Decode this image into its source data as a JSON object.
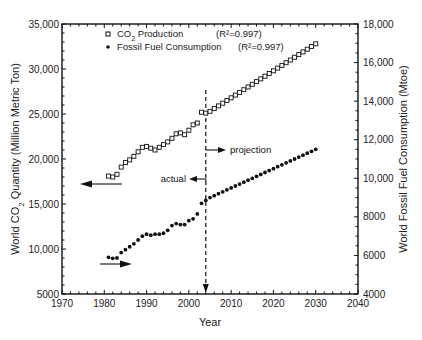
{
  "chart_data": {
    "type": "scatter",
    "title": "",
    "xlabel": "Year",
    "ylabel": "World CO2 Quantity (Million Metric Ton)",
    "ylabel_right": "World Fossil Fuel Consumption (Mtoe)",
    "xlim": [
      1970,
      2040
    ],
    "ylim": [
      5000,
      35000
    ],
    "ylim_right": [
      4000,
      18000
    ],
    "x_ticks": [
      "1970",
      "1980",
      "1990",
      "2000",
      "2010",
      "2020",
      "2030",
      "2040"
    ],
    "y_ticks": [
      "5000",
      "10,000",
      "15,000",
      "20,000",
      "25,000",
      "30,000",
      "35,000"
    ],
    "y_ticks_right": [
      "4000",
      "6000",
      "8000",
      "10,000",
      "12,000",
      "14,000",
      "16,000",
      "18,000"
    ],
    "grid": false,
    "legend_position": "upper left",
    "series": [
      {
        "name": "CO2 Production",
        "r2": "(R²=0.997)",
        "axis": "left",
        "marker": "open-square",
        "x": [
          1981,
          1982,
          1983,
          1984,
          1985,
          1986,
          1987,
          1988,
          1989,
          1990,
          1991,
          1992,
          1993,
          1994,
          1995,
          1996,
          1997,
          1998,
          1999,
          2000,
          2001,
          2002,
          2003,
          2004,
          2005,
          2006,
          2007,
          2008,
          2009,
          2010,
          2011,
          2012,
          2013,
          2014,
          2015,
          2016,
          2017,
          2018,
          2019,
          2020,
          2021,
          2022,
          2023,
          2024,
          2025,
          2026,
          2027,
          2028,
          2029,
          2030
        ],
        "values": [
          18100,
          18000,
          18300,
          19100,
          19600,
          19900,
          20300,
          20800,
          21300,
          21400,
          21200,
          21000,
          21300,
          21600,
          21900,
          22300,
          22800,
          22900,
          22700,
          23200,
          23800,
          24000,
          25200,
          25100,
          25300,
          25600,
          25900,
          26200,
          26500,
          26800,
          27100,
          27400,
          27700,
          28000,
          28300,
          28600,
          28900,
          29200,
          29500,
          29800,
          30100,
          30400,
          30700,
          31000,
          31300,
          31600,
          31900,
          32200,
          32500,
          32800
        ]
      },
      {
        "name": "Fossil Fuel Consumption",
        "r2": "(R²=0.997)",
        "axis": "right",
        "marker": "filled-circle",
        "x": [
          1981,
          1982,
          1983,
          1984,
          1985,
          1986,
          1987,
          1988,
          1989,
          1990,
          1991,
          1992,
          1993,
          1994,
          1995,
          1996,
          1997,
          1998,
          1999,
          2000,
          2001,
          2002,
          2003,
          2004,
          2005,
          2006,
          2007,
          2008,
          2009,
          2010,
          2011,
          2012,
          2013,
          2014,
          2015,
          2016,
          2017,
          2018,
          2019,
          2020,
          2021,
          2022,
          2023,
          2024,
          2025,
          2026,
          2027,
          2028,
          2029,
          2030
        ],
        "values": [
          5900,
          5850,
          5870,
          6150,
          6300,
          6450,
          6600,
          6800,
          7000,
          7100,
          7050,
          7100,
          7100,
          7150,
          7300,
          7550,
          7650,
          7600,
          7600,
          7800,
          7900,
          8150,
          8700,
          8850,
          9000,
          9100,
          9200,
          9300,
          9400,
          9500,
          9600,
          9700,
          9800,
          9900,
          10000,
          10100,
          10200,
          10300,
          10400,
          10500,
          10600,
          10700,
          10800,
          10900,
          11000,
          11100,
          11200,
          11300,
          11400,
          11500
        ]
      }
    ],
    "annotations": [
      {
        "text": "actual",
        "arrow": "left",
        "x": 2004
      },
      {
        "text": "projection",
        "arrow": "right",
        "x": 2004
      },
      {
        "text": "",
        "arrow": "left",
        "desc": "CO2 series uses left axis"
      },
      {
        "text": "",
        "arrow": "right",
        "desc": "Fossil fuel series uses right axis"
      }
    ],
    "divider_year": 2004
  },
  "legend": {
    "co2_label_prefix": "CO",
    "co2_label_sub": "2",
    "co2_label_suffix": " Production",
    "co2_r2": "(R²=0.997)",
    "fuel_label": "Fossil Fuel Consumption",
    "fuel_r2": "(R²=0.997)"
  },
  "annotations": {
    "actual": "actual",
    "projection": "projection"
  },
  "axes": {
    "xlabel": "Year",
    "ylabel_left_a": "World CO",
    "ylabel_left_sub": "2",
    "ylabel_left_b": " Quantity (Million Metric Ton)",
    "ylabel_right": "World Fossil Fuel Consumption (Mtoe)"
  }
}
